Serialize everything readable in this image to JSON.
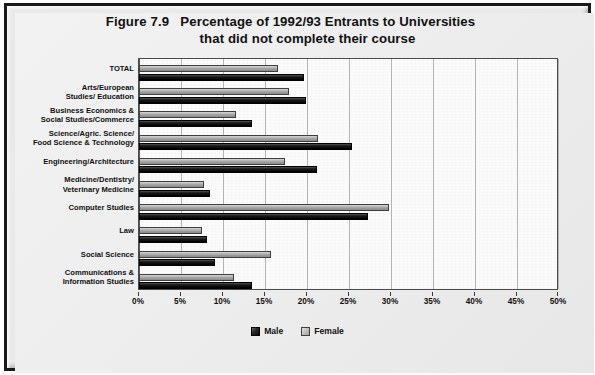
{
  "figure": {
    "title_line1": "Figure 7.9   Percentage of 1992/93 Entrants to Universities",
    "title_line2": "that did not complete their course"
  },
  "legend": {
    "male_label": "Male",
    "female_label": "Female",
    "male_color": "#111111",
    "female_color": "#bdbdbd"
  },
  "axis": {
    "x_ticks": [
      "0%",
      "5%",
      "10%",
      "15%",
      "20%",
      "25%",
      "30%",
      "35%",
      "40%",
      "45%",
      "50%"
    ]
  },
  "chart_data": {
    "type": "bar",
    "orientation": "horizontal",
    "title": "Figure 7.9   Percentage of 1992/93 Entrants to Universities that did not complete their course",
    "xlabel": "",
    "ylabel": "",
    "xlim": [
      0,
      50
    ],
    "xtick_step": 5,
    "xtick_format": "percent",
    "grid": true,
    "legend_position": "bottom-center",
    "categories": [
      "TOTAL",
      "Arts/European\nStudies/ Education",
      "Business Economics &\nSocial Studies/Commerce",
      "Science/Agric. Science/\nFood Science & Technology",
      "Engineering/Architecture",
      "Medicine/Dentistry/\nVeterinary Medicine",
      "Computer Studies",
      "Law",
      "Social Science",
      "Communications &\nInformation Studies"
    ],
    "series": [
      {
        "name": "Male",
        "values": [
          19.6,
          19.9,
          13.5,
          25.3,
          21.2,
          8.5,
          27.3,
          8.1,
          9.0,
          13.5
        ]
      },
      {
        "name": "Female",
        "values": [
          16.5,
          17.8,
          11.5,
          21.3,
          17.4,
          7.7,
          29.8,
          7.5,
          15.7,
          11.3
        ]
      }
    ]
  }
}
